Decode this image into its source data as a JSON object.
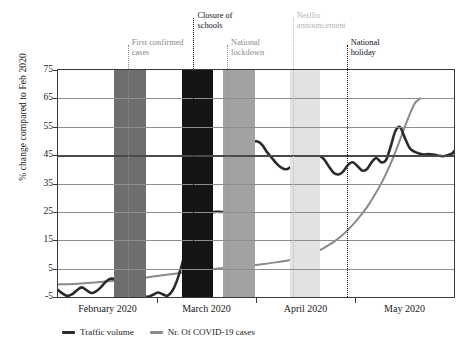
{
  "chart_data": {
    "type": "line",
    "title": "",
    "xlabel": "",
    "ylabel": "% change compared to Feb 2020",
    "ylim": [
      -5,
      75
    ],
    "yticks": [
      -5,
      5,
      15,
      25,
      35,
      45,
      55,
      65,
      75
    ],
    "ytick_labels": [
      "-5",
      "5",
      "15",
      "25",
      "35",
      "45",
      "55",
      "65",
      "75"
    ],
    "xtick_labels": [
      "February 2020",
      "March 2020",
      "April 2020",
      "May 2020"
    ],
    "grid": true,
    "legend_position": "bottom-left",
    "series": [
      {
        "name": "Traffic volume",
        "color": "#2b2b2b",
        "x": [
          0,
          1.2,
          2.4,
          3.6,
          4.8,
          6.0,
          7.2,
          8.4,
          9.6,
          10.8,
          12.0,
          13.2,
          14.4,
          15.6,
          16.8,
          18.0,
          19.2,
          20.4,
          21.6,
          22.8,
          24.0,
          25.2,
          26.4,
          27.6,
          28.8,
          30.0,
          31.2,
          32.4,
          33.6,
          34.8,
          36.0,
          37.2,
          38.4,
          39.6,
          40.8,
          42.0,
          43.2,
          44.4,
          45.6,
          46.8,
          48.0,
          49.2,
          50.4,
          51.6,
          52.8,
          54.0,
          55.2,
          56.4,
          57.6,
          58.8,
          60.0,
          61.2,
          62.4,
          63.6,
          64.8,
          66.0,
          67.2,
          68.4,
          69.6,
          70.8,
          72.0,
          73.2,
          74.4,
          75.6,
          76.8,
          78.0,
          79.2,
          80.4,
          81.6,
          82.8,
          84.0,
          85.2,
          86.4,
          87.6,
          88.8,
          90.0,
          91.2,
          92.4,
          93.6,
          94.8,
          96.0,
          97.2,
          98.4,
          99.6,
          100
        ],
        "values": [
          -2.5,
          -3.8,
          -4.6,
          -4.0,
          -2.6,
          -1.6,
          -2.6,
          -3.6,
          -3.0,
          -1.6,
          0.3,
          1.4,
          1.2,
          0.0,
          -1.2,
          -1.6,
          -2.2,
          -3.6,
          -4.6,
          -4.9,
          -4.2,
          -3.4,
          -4.0,
          -4.6,
          -3.0,
          0.6,
          6.0,
          12.0,
          16.0,
          17.2,
          18.0,
          21.0,
          24.2,
          25.0,
          25.0,
          25.2,
          27.5,
          33.0,
          39.0,
          44.0,
          47.5,
          49.5,
          49.8,
          48.5,
          46.0,
          44.0,
          42.0,
          40.6,
          40.0,
          40.8,
          41.8,
          41.5,
          40.8,
          41.5,
          43.0,
          44.6,
          43.5,
          41.0,
          38.8,
          38.2,
          39.2,
          41.5,
          42.5,
          41.2,
          39.6,
          40.0,
          42.5,
          44.0,
          42.5,
          43.2,
          48.0,
          53.5,
          54.8,
          51.0,
          47.5,
          46.2,
          45.6,
          45.2,
          45.4,
          45.2,
          44.8,
          44.6,
          45.0,
          45.6,
          46.4
        ]
      },
      {
        "name": "Nr. Of COVID-19 cases",
        "color": "#8a8a8a",
        "x": [
          0,
          5,
          10,
          15,
          20,
          25,
          30,
          35,
          40,
          45,
          50,
          55,
          60,
          62,
          64,
          66,
          68,
          70,
          72,
          74,
          76,
          78,
          80,
          82,
          84,
          86,
          88,
          90,
          91.5
        ],
        "values": [
          -0.6,
          -0.3,
          0.2,
          0.8,
          1.5,
          2.4,
          3.3,
          4.2,
          5.0,
          5.6,
          6.3,
          7.2,
          8.4,
          9.2,
          10.2,
          11.4,
          13.0,
          14.8,
          17.0,
          19.8,
          23.0,
          26.6,
          31.0,
          36.0,
          42.0,
          49.0,
          56.5,
          63.0,
          65.0
        ]
      }
    ],
    "bands": [
      {
        "name": "first-confirmed-cases-band",
        "x_start": 14.1,
        "x_end": 22.1,
        "color": "#6e6e6e"
      },
      {
        "name": "closure-of-schools-band",
        "x_start": 31.4,
        "x_end": 39.2,
        "color": "#141414"
      },
      {
        "name": "national-lockdown-band",
        "x_start": 41.7,
        "x_end": 49.7,
        "color": "#a2a2a2"
      },
      {
        "name": "netflix-announcement-band",
        "x_start": 58.5,
        "x_end": 66.1,
        "color": "#e2e2e2"
      }
    ],
    "events": [
      {
        "name": "first-confirmed-cases",
        "label": "First confirmed\ncases",
        "x": 17.6,
        "color": "#8b8b8b",
        "line_style": "dotted"
      },
      {
        "name": "closure-of-schools",
        "label": "Closure of\nschools",
        "x": 34.2,
        "color": "#111111",
        "line_style": "dotted"
      },
      {
        "name": "national-lockdown",
        "label": "National\nlockdown",
        "x": 42.7,
        "color": "#8b8b8b",
        "line_style": "dotted"
      },
      {
        "name": "netflix-announcement",
        "label": "Netflix\nannouncement",
        "x": 59.3,
        "color": "#b5b5b5",
        "line_style": "dotted"
      },
      {
        "name": "national-holiday",
        "label": "National\nholiday",
        "x": 72.9,
        "color": "#111111",
        "line_style": "dotted"
      }
    ]
  },
  "axis": {
    "y_title": "% change compared to Feb 2020"
  },
  "legend": {
    "items": [
      {
        "label": "Traffic volume",
        "color": "#2b2b2b"
      },
      {
        "label": "Nr. Of COVID-19 cases",
        "color": "#8a8a8a"
      }
    ]
  }
}
